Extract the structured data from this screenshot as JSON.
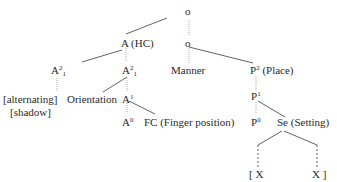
{
  "diagram": {
    "type": "feature-geometry tree",
    "nodes": {
      "root": {
        "label": "o"
      },
      "a_hc": {
        "label": "A",
        "annot": "(HC)"
      },
      "o2": {
        "label": "o"
      },
      "a21_left": {
        "label": "A",
        "sup": "2",
        "sub": "1"
      },
      "a21_right": {
        "label": "A",
        "sup": "2",
        "sub": "1"
      },
      "manner": {
        "label": "Manner"
      },
      "p2": {
        "label": "P",
        "sup": "2",
        "annot": "(Place)"
      },
      "alternating": {
        "label": "[alternating]"
      },
      "shadow": {
        "label": "[shadow]"
      },
      "orientation": {
        "label": "Orientation"
      },
      "a1": {
        "label": "A",
        "sup": "1"
      },
      "p1": {
        "label": "P",
        "sup": "1"
      },
      "a0": {
        "label": "A",
        "sup": "0"
      },
      "fc": {
        "label": "FC (Finger position)"
      },
      "p0": {
        "label": "P",
        "sup": "0"
      },
      "se": {
        "label": "Se (Setting)"
      },
      "x_left": {
        "label": "[ X"
      },
      "x_right": {
        "label": "X ]"
      }
    },
    "colors": {
      "line": "#3a3a3a",
      "dotted": "#9a9a9a",
      "text": "#2a2a2a"
    }
  }
}
